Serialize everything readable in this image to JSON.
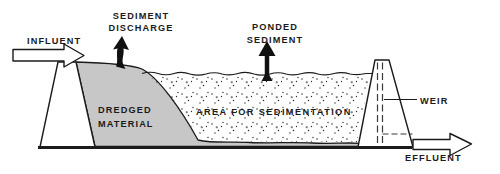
{
  "diagram": {
    "type": "cross-section schematic of a dredged material containment basin",
    "labels": {
      "influent": "INFLUENT",
      "sediment_discharge_line1": "SEDIMENT",
      "sediment_discharge_line2": "DISCHARGE",
      "ponded_sediment_line1": "PONDED",
      "ponded_sediment_line2": "SEDIMENT",
      "dredged_material_line1": "DREDGED",
      "dredged_material_line2": "MATERIAL",
      "area_for_sedimentation": "AREA FOR SEDIMENTATION",
      "weir": "WEIR",
      "effluent": "EFFLUENT"
    },
    "colors": {
      "background": "#ffffff",
      "line": "#1b1b1b",
      "dredged_material_fill": "#c7c7c7",
      "stipple_dot": "#2a2a2a",
      "text": "#1b1b1b"
    }
  }
}
